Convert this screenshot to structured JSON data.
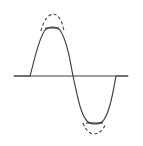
{
  "figure": {
    "background_color": "#ffffff",
    "stroke_color": "#3f3f3f",
    "dashed_stroke_color": "#4a4a4a",
    "stroke_width": 1.15,
    "dash_pattern": "3.2 2.4",
    "canvas": {
      "width": 143,
      "height": 146
    }
  },
  "chart_data": {
    "type": "line",
    "xlabel": "",
    "ylabel": "",
    "grid": false,
    "legend": false,
    "axis": {
      "zero_line_y": 76,
      "x_start": 14,
      "x_end": 128
    },
    "zero_crossings": [
      30,
      73,
      116
    ],
    "period_px": 86,
    "amplitude_px": 61,
    "clipped_amplitude_px": 48,
    "positive_peak": {
      "clipped_y": 28,
      "unclipped_y": 15,
      "flat_x_start": 45,
      "flat_x_end": 59,
      "dashed_x_start": 41,
      "dashed_x_end": 64
    },
    "negative_trough": {
      "clipped_y": 123,
      "unclipped_y": 134,
      "flat_x_start": 86,
      "flat_x_end": 103,
      "dashed_x_start": 83,
      "dashed_x_end": 106
    },
    "series": [
      {
        "name": "clipped-signal",
        "style": "solid",
        "path": "M 14 76 L 30 76 C 34 62 38 40 45 30 C 49 26 56 26 60 30 C 67 41 70 60 73 76 C 77 94 80 113 87 121 C 91 125 99 125 103 121 C 110 112 113 92 116 76 L 128 76"
      },
      {
        "name": "original-unclipped-positive-peak",
        "style": "dashed",
        "path": "M 41 31 C 44 18 50 14 53 14 C 57 14 62 19 64 31"
      },
      {
        "name": "original-unclipped-negative-trough",
        "style": "dashed",
        "path": "M 83 123 C 86 131 90 134 94 134 C 98 134 103 131 106 123"
      }
    ]
  },
  "elements": {
    "axis_label": "horizontal zero axis",
    "solid_wave_label": "clipped sine wave",
    "dashed_top_label": "dashed original positive peak",
    "dashed_bottom_label": "dashed original negative trough",
    "flat_top_label": "flattened positive clip level",
    "flat_bottom_label": "flattened negative clip level"
  }
}
